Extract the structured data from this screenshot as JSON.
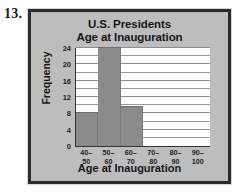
{
  "problem": {
    "number": "13."
  },
  "chart_data": {
    "type": "bar",
    "title": "U.S. Presidents",
    "subtitle": "Age at Inauguration",
    "xlabel": "Age at Inauguration",
    "ylabel": "Frequency",
    "categories": [
      "40–\n50",
      "50–\n60",
      "60–\n70",
      "70–\n80",
      "80–\n90",
      "90–\n100"
    ],
    "category_parts": [
      {
        "lo": "40–",
        "hi": "50"
      },
      {
        "lo": "50–",
        "hi": "60"
      },
      {
        "lo": "60–",
        "hi": "70"
      },
      {
        "lo": "70–",
        "hi": "80"
      },
      {
        "lo": "80–",
        "hi": "90"
      },
      {
        "lo": "90–",
        "hi": "100"
      }
    ],
    "values": [
      8,
      24,
      9.5,
      0,
      0,
      0
    ],
    "ylim": [
      0,
      24
    ],
    "ytick_labels": [
      "0",
      "4",
      "8",
      "12",
      "16",
      "20",
      "24"
    ],
    "ytick_values": [
      0,
      4,
      8,
      12,
      16,
      20,
      24
    ],
    "gridline_values": [
      2,
      4,
      6,
      8,
      10,
      12,
      14,
      16,
      18,
      20,
      22,
      24
    ],
    "grid": true,
    "legend": "none",
    "colors": {
      "bar_fill": "#8b8b8b",
      "plot_background": "#ffffff",
      "panel_background": "#bdbdbd",
      "frame_border": "#2b2b2b",
      "gridline": "#9a9a9a",
      "axis": "#333333",
      "text": "#161616"
    }
  }
}
